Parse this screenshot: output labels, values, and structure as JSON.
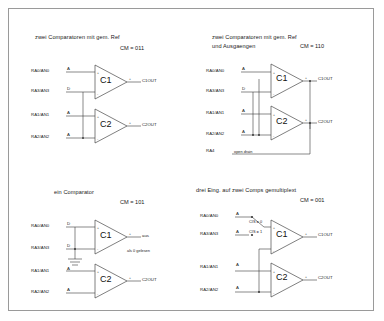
{
  "diagram": {
    "border_color": "#9a9a9a",
    "wire_color": "#3a3a3a",
    "background": "#ffffff"
  },
  "quadrants": [
    {
      "id": "cm-011",
      "title": "zwei Comparatoren mit gem. Ref",
      "title_line2": "",
      "cm_label": "CM = 011",
      "comparators": [
        {
          "name": "C1",
          "output": "C1OUT"
        },
        {
          "name": "C2",
          "output": "C2OUT"
        }
      ],
      "pins": [
        {
          "label": "RA0/AN0",
          "mode": "A"
        },
        {
          "label": "RA3/AN3",
          "mode": "D"
        },
        {
          "label": "RA1/AN1",
          "mode": "A"
        },
        {
          "label": "RA2/AN2",
          "mode": "A"
        }
      ],
      "notes": []
    },
    {
      "id": "cm-110",
      "title": "zwei Comparatoren mit gem. Ref",
      "title_line2": "und Ausgaengen",
      "cm_label": "CM = 110",
      "comparators": [
        {
          "name": "C1",
          "output": "C1OUT"
        },
        {
          "name": "C2",
          "output": "C2OUT"
        }
      ],
      "pins": [
        {
          "label": "RA0/AN0",
          "mode": "A"
        },
        {
          "label": "RA3/AN3",
          "mode": "D"
        },
        {
          "label": "RA1/AN1",
          "mode": "A"
        },
        {
          "label": "RA2/AN2",
          "mode": "A"
        },
        {
          "label": "RA4",
          "mode": ""
        }
      ],
      "notes": [
        {
          "text": "open drain"
        }
      ]
    },
    {
      "id": "cm-101",
      "title": "ein Comparator",
      "title_line2": "",
      "cm_label": "CM = 101",
      "comparators": [
        {
          "name": "C1",
          "output": "aus"
        },
        {
          "name": "C2",
          "output": "C2OUT"
        }
      ],
      "pins": [
        {
          "label": "RA0/AN0",
          "mode": "D"
        },
        {
          "label": "RA3/AN3",
          "mode": "D"
        },
        {
          "label": "RA1/AN1",
          "mode": "A"
        },
        {
          "label": "RA2/AN2",
          "mode": "A"
        }
      ],
      "notes": [
        {
          "text": "als 0 gelesen"
        }
      ]
    },
    {
      "id": "cm-001",
      "title": "drei Eing. auf zwei Comps gemultiplext",
      "title_line2": "",
      "cm_label": "CM = 001",
      "comparators": [
        {
          "name": "C1",
          "output": "C1OUT"
        },
        {
          "name": "C2",
          "output": "C2OUT"
        }
      ],
      "pins": [
        {
          "label": "RA0/AN0",
          "mode": "A"
        },
        {
          "label": "RA3/AN3",
          "mode": "A"
        },
        {
          "label": "RA1/AN1",
          "mode": "A"
        },
        {
          "label": "RA2/AN2",
          "mode": "A"
        }
      ],
      "notes": [
        {
          "text": "CIS = 0"
        },
        {
          "text": "CIS = 1"
        }
      ]
    }
  ]
}
